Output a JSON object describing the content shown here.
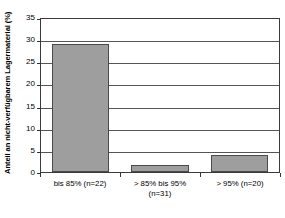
{
  "chart_data": {
    "type": "bar",
    "title": "",
    "xlabel": "",
    "ylabel": "Anteil an nicht-verfügbarem Lagermaterial (%)",
    "categories": [
      "bis 85% (n=22)",
      "> 85% bis 95% (n=31)",
      "> 95% (n=20)"
    ],
    "category_lines": [
      [
        "bis 85% (n=22)",
        ""
      ],
      [
        "> 85% bis 95%",
        "(n=31)"
      ],
      [
        "> 95% (n=20)",
        ""
      ]
    ],
    "values": [
      28.8,
      1.5,
      3.8
    ],
    "ylim": [
      0,
      35
    ],
    "yticks": [
      0,
      5,
      10,
      15,
      20,
      25,
      30,
      35
    ],
    "ytick_labels": [
      "0",
      "5",
      "10",
      "15",
      "20",
      "25",
      "30",
      "35"
    ],
    "grid": true,
    "legend": false,
    "bar_color": "#9e9e9e",
    "bar_edge_color": "#4a4a4a",
    "axis_color": "#3a3a3a",
    "gridline_color": "#555555",
    "background": "#ffffff"
  }
}
